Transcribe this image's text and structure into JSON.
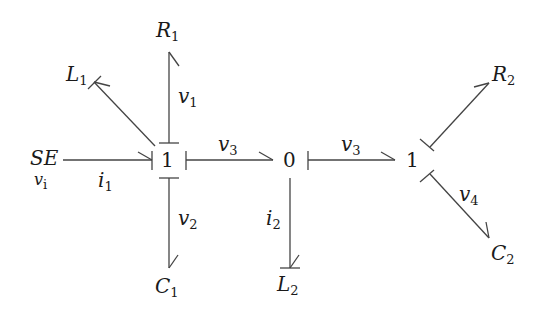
{
  "diagram": {
    "type": "bond-graph",
    "colors": {
      "line": "#444444",
      "text": "#1a1a1a",
      "background": "#ffffff"
    },
    "junctions": [
      {
        "id": "j1a",
        "label": "1"
      },
      {
        "id": "j0",
        "label": "0"
      },
      {
        "id": "j1b",
        "label": "1"
      }
    ],
    "elements": {
      "se": {
        "main": "SE",
        "sub": "v",
        "subsub": "i"
      },
      "r1": {
        "main": "R",
        "sub": "1"
      },
      "l1": {
        "main": "L",
        "sub": "1"
      },
      "c1": {
        "main": "C",
        "sub": "1"
      },
      "l2": {
        "main": "L",
        "sub": "2"
      },
      "r2": {
        "main": "R",
        "sub": "2"
      },
      "c2": {
        "main": "C",
        "sub": "2"
      }
    },
    "bond_labels": {
      "i1": {
        "main": "i",
        "sub": "1"
      },
      "v1": {
        "main": "v",
        "sub": "1"
      },
      "v2": {
        "main": "v",
        "sub": "2"
      },
      "v3a": {
        "main": "v",
        "sub": "3"
      },
      "v3b": {
        "main": "v",
        "sub": "3"
      },
      "i2": {
        "main": "i",
        "sub": "2"
      },
      "v4": {
        "main": "v",
        "sub": "4"
      }
    }
  }
}
